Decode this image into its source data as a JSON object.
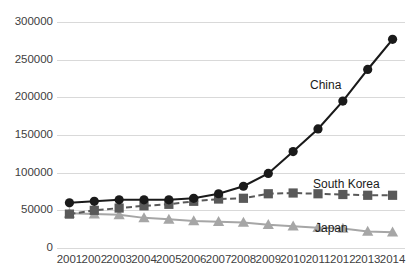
{
  "chart_data": {
    "type": "line",
    "title": "",
    "xlabel": "",
    "ylabel": "",
    "grid": true,
    "legend_position": "inline-labels",
    "categories": [
      "2001",
      "2002",
      "2003",
      "2004",
      "2005",
      "2006",
      "2007",
      "2008",
      "2009",
      "2010",
      "2011",
      "2012",
      "2013",
      "2014"
    ],
    "x": [
      2001,
      2002,
      2003,
      2004,
      2005,
      2006,
      2007,
      2008,
      2009,
      2010,
      2011,
      2012,
      2013,
      2014
    ],
    "ylim": [
      0,
      300000
    ],
    "yticks": [
      0,
      50000,
      100000,
      150000,
      200000,
      250000,
      300000
    ],
    "ytick_labels": [
      "0",
      "50000",
      "100000",
      "150000",
      "200000",
      "250000",
      "300000"
    ],
    "series": [
      {
        "name": "China",
        "color": "#1a1a1a",
        "marker": "circle",
        "linestyle": "solid",
        "values": [
          60000,
          62000,
          64000,
          64000,
          64000,
          66000,
          72000,
          82000,
          99000,
          128000,
          158000,
          195000,
          237000,
          277000
        ]
      },
      {
        "name": "South Korea",
        "color": "#595959",
        "marker": "square",
        "linestyle": "dashed",
        "values": [
          45000,
          50000,
          53000,
          56000,
          58000,
          62000,
          65000,
          66000,
          72000,
          73000,
          72000,
          71000,
          70000,
          70000
        ]
      },
      {
        "name": "Japan",
        "color": "#a6a6a6",
        "marker": "triangle",
        "linestyle": "solid",
        "values": [
          46000,
          45000,
          44000,
          40000,
          38000,
          36000,
          35000,
          34000,
          31000,
          29000,
          27000,
          26000,
          22000,
          21000
        ]
      }
    ]
  },
  "labels": {
    "china": "China",
    "south_korea": "South Korea",
    "japan": "Japan"
  },
  "colors": {
    "china": "#1a1a1a",
    "south_korea": "#595959",
    "japan": "#a6a6a6",
    "grid": "#d9d9d9",
    "text": "#404040",
    "background": "#ffffff"
  }
}
